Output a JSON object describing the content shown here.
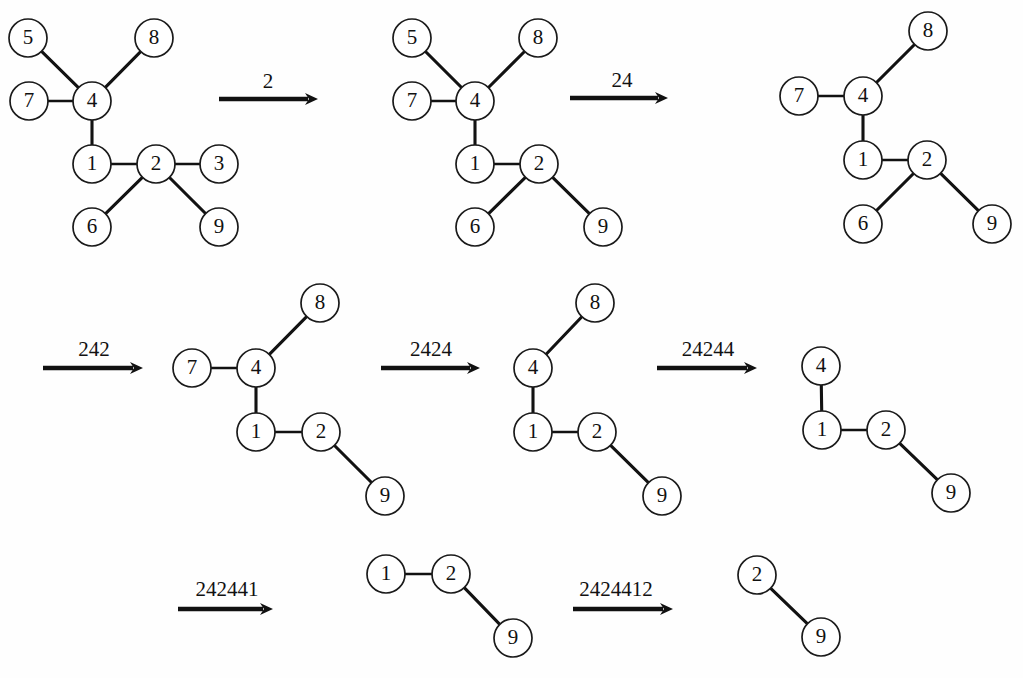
{
  "figure": {
    "background_color": "#fefefe",
    "node_fill": "#ffffff",
    "stroke_color": "#111111",
    "node_radius": 19
  },
  "graphs": [
    {
      "id": "graph-1",
      "nodes": [
        {
          "label": "5",
          "x": 28,
          "y": 38
        },
        {
          "label": "8",
          "x": 154,
          "y": 38
        },
        {
          "label": "7",
          "x": 29,
          "y": 101
        },
        {
          "label": "4",
          "x": 92,
          "y": 101
        },
        {
          "label": "1",
          "x": 92,
          "y": 164
        },
        {
          "label": "2",
          "x": 156,
          "y": 164
        },
        {
          "label": "3",
          "x": 219,
          "y": 164
        },
        {
          "label": "6",
          "x": 92,
          "y": 227
        },
        {
          "label": "9",
          "x": 219,
          "y": 227
        }
      ],
      "edges": [
        [
          "5",
          "4"
        ],
        [
          "8",
          "4"
        ],
        [
          "7",
          "4"
        ],
        [
          "4",
          "1"
        ],
        [
          "1",
          "2"
        ],
        [
          "2",
          "3"
        ],
        [
          "2",
          "6"
        ],
        [
          "2",
          "9"
        ]
      ]
    },
    {
      "id": "graph-2",
      "nodes": [
        {
          "label": "5",
          "x": 412,
          "y": 38
        },
        {
          "label": "8",
          "x": 538,
          "y": 38
        },
        {
          "label": "7",
          "x": 412,
          "y": 101
        },
        {
          "label": "4",
          "x": 475,
          "y": 101
        },
        {
          "label": "1",
          "x": 475,
          "y": 164
        },
        {
          "label": "2",
          "x": 539,
          "y": 164
        },
        {
          "label": "6",
          "x": 475,
          "y": 227
        },
        {
          "label": "9",
          "x": 603,
          "y": 227
        }
      ],
      "edges": [
        [
          "5",
          "4"
        ],
        [
          "8",
          "4"
        ],
        [
          "7",
          "4"
        ],
        [
          "4",
          "1"
        ],
        [
          "1",
          "2"
        ],
        [
          "2",
          "6"
        ],
        [
          "2",
          "9"
        ]
      ]
    },
    {
      "id": "graph-3",
      "nodes": [
        {
          "label": "8",
          "x": 928,
          "y": 31
        },
        {
          "label": "7",
          "x": 799,
          "y": 96
        },
        {
          "label": "4",
          "x": 863,
          "y": 96
        },
        {
          "label": "1",
          "x": 863,
          "y": 160
        },
        {
          "label": "2",
          "x": 927,
          "y": 160
        },
        {
          "label": "6",
          "x": 863,
          "y": 224
        },
        {
          "label": "9",
          "x": 992,
          "y": 224
        }
      ],
      "edges": [
        [
          "8",
          "4"
        ],
        [
          "7",
          "4"
        ],
        [
          "4",
          "1"
        ],
        [
          "1",
          "2"
        ],
        [
          "2",
          "6"
        ],
        [
          "2",
          "9"
        ]
      ]
    },
    {
      "id": "graph-4",
      "nodes": [
        {
          "label": "8",
          "x": 320,
          "y": 303
        },
        {
          "label": "7",
          "x": 192,
          "y": 368
        },
        {
          "label": "4",
          "x": 256,
          "y": 368
        },
        {
          "label": "1",
          "x": 256,
          "y": 432
        },
        {
          "label": "2",
          "x": 321,
          "y": 432
        },
        {
          "label": "9",
          "x": 385,
          "y": 496
        }
      ],
      "edges": [
        [
          "8",
          "4"
        ],
        [
          "7",
          "4"
        ],
        [
          "4",
          "1"
        ],
        [
          "1",
          "2"
        ],
        [
          "2",
          "9"
        ]
      ]
    },
    {
      "id": "graph-5",
      "nodes": [
        {
          "label": "8",
          "x": 595,
          "y": 303
        },
        {
          "label": "4",
          "x": 533,
          "y": 368
        },
        {
          "label": "1",
          "x": 533,
          "y": 432
        },
        {
          "label": "2",
          "x": 597,
          "y": 432
        },
        {
          "label": "9",
          "x": 662,
          "y": 496
        }
      ],
      "edges": [
        [
          "8",
          "4"
        ],
        [
          "4",
          "1"
        ],
        [
          "1",
          "2"
        ],
        [
          "2",
          "9"
        ]
      ]
    },
    {
      "id": "graph-6",
      "nodes": [
        {
          "label": "4",
          "x": 821,
          "y": 366
        },
        {
          "label": "1",
          "x": 822,
          "y": 430
        },
        {
          "label": "2",
          "x": 886,
          "y": 430
        },
        {
          "label": "9",
          "x": 951,
          "y": 493
        }
      ],
      "edges": [
        [
          "4",
          "1"
        ],
        [
          "1",
          "2"
        ],
        [
          "2",
          "9"
        ]
      ]
    },
    {
      "id": "graph-7",
      "nodes": [
        {
          "label": "1",
          "x": 386,
          "y": 574
        },
        {
          "label": "2",
          "x": 451,
          "y": 574
        },
        {
          "label": "9",
          "x": 513,
          "y": 638
        }
      ],
      "edges": [
        [
          "1",
          "2"
        ],
        [
          "2",
          "9"
        ]
      ]
    },
    {
      "id": "graph-8",
      "nodes": [
        {
          "label": "2",
          "x": 757,
          "y": 575
        },
        {
          "label": "9",
          "x": 821,
          "y": 637
        }
      ],
      "edges": [
        [
          "2",
          "9"
        ]
      ]
    }
  ],
  "arrows": [
    {
      "id": "arrow-1",
      "label": "2",
      "x1": 219,
      "y1": 99,
      "x2": 318,
      "y2": 99,
      "label_x": 268,
      "label_y": 88
    },
    {
      "id": "arrow-2",
      "label": "24",
      "x1": 570,
      "y1": 98,
      "x2": 668,
      "y2": 98,
      "label_x": 622,
      "label_y": 87
    },
    {
      "id": "arrow-3",
      "label": "242",
      "x1": 43,
      "y1": 368,
      "x2": 143,
      "y2": 368,
      "label_x": 94,
      "label_y": 356
    },
    {
      "id": "arrow-4",
      "label": "2424",
      "x1": 381,
      "y1": 368,
      "x2": 480,
      "y2": 368,
      "label_x": 431,
      "label_y": 356
    },
    {
      "id": "arrow-5",
      "label": "24244",
      "x1": 657,
      "y1": 368,
      "x2": 757,
      "y2": 368,
      "label_x": 708,
      "label_y": 356
    },
    {
      "id": "arrow-6",
      "label": "242441",
      "x1": 178,
      "y1": 609,
      "x2": 273,
      "y2": 609,
      "label_x": 227,
      "label_y": 596
    },
    {
      "id": "arrow-7",
      "label": "2424412",
      "x1": 573,
      "y1": 609,
      "x2": 673,
      "y2": 609,
      "label_x": 616,
      "label_y": 596
    }
  ]
}
